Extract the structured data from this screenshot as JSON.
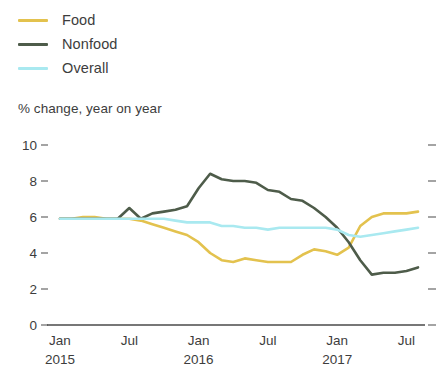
{
  "legend": {
    "items": [
      {
        "label": "Food",
        "color": "#e3c24e",
        "name": "legend-item-food"
      },
      {
        "label": "Nonfood",
        "color": "#4e5c4a",
        "name": "legend-item-nonfood"
      },
      {
        "label": "Overall",
        "color": "#a9e9f0",
        "name": "legend-item-overall"
      }
    ]
  },
  "subtitle": "% change, year on year",
  "chart_data": {
    "type": "line",
    "title": "",
    "subtitle": "% change, year on year",
    "xlabel": "",
    "ylabel": "% change, year on year",
    "ylim": [
      0,
      10
    ],
    "yticks": [
      0,
      2,
      4,
      6,
      8,
      10
    ],
    "ytick_labels": [
      "0",
      "2",
      "4",
      "6",
      "8",
      "10"
    ],
    "grid": false,
    "legend_position": "top-left",
    "x_tick_positions": [
      0,
      6,
      12,
      18,
      24,
      30
    ],
    "x_tick_labels": [
      "Jan",
      "Jul",
      "Jan",
      "Jul",
      "Jan",
      "Jul"
    ],
    "x_tick_sublabels": [
      "2015",
      "",
      "2016",
      "",
      "2017",
      ""
    ],
    "x": [
      "Jan 2015",
      "Feb 2015",
      "Mar 2015",
      "Apr 2015",
      "May 2015",
      "Jun 2015",
      "Jul 2015",
      "Aug 2015",
      "Sep 2015",
      "Oct 2015",
      "Nov 2015",
      "Dec 2015",
      "Jan 2016",
      "Feb 2016",
      "Mar 2016",
      "Apr 2016",
      "May 2016",
      "Jun 2016",
      "Jul 2016",
      "Aug 2016",
      "Sep 2016",
      "Oct 2016",
      "Nov 2016",
      "Dec 2016",
      "Jan 2017",
      "Feb 2017",
      "Mar 2017",
      "Apr 2017",
      "May 2017",
      "Jun 2017",
      "Jul 2017",
      "Aug 2017"
    ],
    "series": [
      {
        "name": "Food",
        "color": "#e3c24e",
        "values": [
          5.9,
          5.9,
          6.0,
          6.0,
          5.9,
          5.9,
          5.9,
          5.8,
          5.6,
          5.4,
          5.2,
          5.0,
          4.6,
          4.0,
          3.6,
          3.5,
          3.7,
          3.6,
          3.5,
          3.5,
          3.5,
          3.9,
          4.2,
          4.1,
          3.9,
          4.3,
          5.5,
          6.0,
          6.2,
          6.2,
          6.2,
          6.3
        ]
      },
      {
        "name": "Nonfood",
        "color": "#4e5c4a",
        "values": [
          5.9,
          5.9,
          5.9,
          5.9,
          5.9,
          5.9,
          6.5,
          5.9,
          6.2,
          6.3,
          6.4,
          6.6,
          7.6,
          8.4,
          8.1,
          8.0,
          8.0,
          7.9,
          7.5,
          7.4,
          7.0,
          6.9,
          6.5,
          6.0,
          5.4,
          4.6,
          3.6,
          2.8,
          2.9,
          2.9,
          3.0,
          3.2
        ]
      },
      {
        "name": "Overall",
        "color": "#a9e9f0",
        "values": [
          5.9,
          5.9,
          5.9,
          5.9,
          5.9,
          5.9,
          5.9,
          5.9,
          5.9,
          5.9,
          5.8,
          5.7,
          5.7,
          5.7,
          5.5,
          5.5,
          5.4,
          5.4,
          5.3,
          5.4,
          5.4,
          5.4,
          5.4,
          5.4,
          5.3,
          5.0,
          4.9,
          5.0,
          5.1,
          5.2,
          5.3,
          5.4
        ]
      }
    ]
  },
  "geometry": {
    "plot_left": 47,
    "plot_right": 425,
    "axis_y_zero": 325,
    "axis_y_ten": 145,
    "line_start_x": 60,
    "line_end_x": 418
  }
}
